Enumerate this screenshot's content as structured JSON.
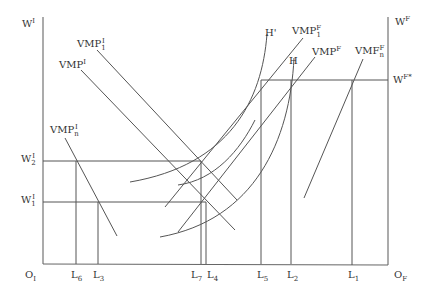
{
  "figure": {
    "type": "two-sector labor market diagram",
    "left_axis_label": "W",
    "left_axis_sup": "I",
    "right_axis_label": "W",
    "right_axis_sup": "F",
    "wage_fstar_label": "W",
    "wage_fstar_sup": "F*",
    "w2_label": "W",
    "w2_sup": "I",
    "w2_sub": "2",
    "w1_label": "W",
    "w1_sup": "I",
    "w1_sub": "1",
    "origin_left": "O",
    "origin_left_sub": "I",
    "origin_right": "O",
    "origin_right_sub": "F",
    "curves": {
      "vmp1_i": {
        "base": "VMP",
        "sup": "I",
        "sub": "1"
      },
      "vmp_i": {
        "base": "VMP",
        "sup": "I"
      },
      "vmpn_i": {
        "base": "VMP",
        "sup": "I",
        "sub": "n"
      },
      "h_prime": {
        "label": "H'"
      },
      "vmp1_f": {
        "base": "VMP",
        "sup": "F",
        "sub": "1"
      },
      "vmp_f": {
        "base": "VMP",
        "sup": "F"
      },
      "h": {
        "label": "H"
      },
      "vmfn_f": {
        "base": "VMF",
        "sup": "F",
        "sub": "n"
      }
    },
    "x_ticks": [
      {
        "label": "L",
        "sub": "6"
      },
      {
        "label": "L",
        "sub": "3"
      },
      {
        "label": "L",
        "sub": "7"
      },
      {
        "label": "L",
        "sub": "4"
      },
      {
        "label": "L",
        "sub": "5"
      },
      {
        "label": "L",
        "sub": "2"
      },
      {
        "label": "L",
        "sub": "1"
      }
    ]
  }
}
